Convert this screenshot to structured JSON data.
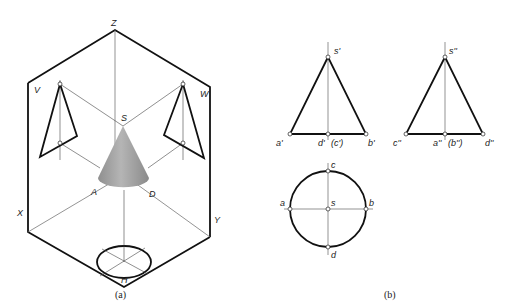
{
  "figure_a": {
    "caption": "(a)",
    "labels": {
      "z": "Z",
      "x": "X",
      "y": "Y",
      "v": "V",
      "w": "W",
      "h": "H",
      "s": "S",
      "a": "A",
      "d": "D"
    }
  },
  "figure_b": {
    "caption": "(b)",
    "front_view": {
      "apex": "s'",
      "left": "a'",
      "center": "d'",
      "center_hidden": "(c')",
      "right": "b'"
    },
    "side_view": {
      "apex": "s''",
      "left": "c''",
      "center": "a''",
      "center_hidden": "(b'')",
      "right": "d''"
    },
    "top_view": {
      "top": "c",
      "left": "a",
      "center": "s",
      "right": "b",
      "bottom": "d"
    }
  },
  "colors": {
    "line": "#111111",
    "cone_light": "#b8b8b8",
    "cone_dark": "#8a8a8a"
  }
}
